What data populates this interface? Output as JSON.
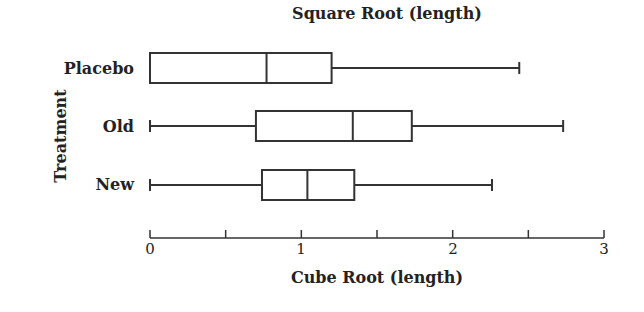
{
  "chart_data": {
    "type": "boxplot",
    "title": "Square Root (length)",
    "xlabel": "Cube Root (length)",
    "ylabel": "Treatment",
    "xlim": [
      0,
      3
    ],
    "xticks": [
      0,
      0.5,
      1,
      1.5,
      2,
      2.5,
      3
    ],
    "xtick_labels": [
      "0",
      "1",
      "2",
      "3"
    ],
    "orientation": "horizontal",
    "categories": [
      "Placebo",
      "Old",
      "New"
    ],
    "series": [
      {
        "name": "Placebo",
        "min": 0.0,
        "q1": 0.0,
        "median": 0.77,
        "q3": 1.2,
        "max": 2.44
      },
      {
        "name": "Old",
        "min": 0.0,
        "q1": 0.7,
        "median": 1.34,
        "q3": 1.73,
        "max": 2.73
      },
      {
        "name": "New",
        "min": 0.0,
        "q1": 0.74,
        "median": 1.04,
        "q3": 1.35,
        "max": 2.26
      }
    ]
  },
  "labels": {
    "title": "Square Root (length)",
    "xlabel": "Cube Root (length)",
    "ylabel": "Treatment",
    "cats": [
      "Placebo",
      "Old",
      "New"
    ],
    "ticks": [
      "0",
      "1",
      "2",
      "3"
    ]
  }
}
